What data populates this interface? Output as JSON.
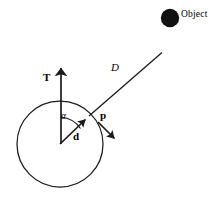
{
  "figure": {
    "width": 223,
    "height": 203,
    "background_color": "#ffffff",
    "stroke_color": "#1a1a1a"
  },
  "labels": {
    "object": "Object",
    "distance": "D",
    "tangent": "T",
    "direction": "d",
    "momentum": "p",
    "angle": "α"
  },
  "geometry": {
    "body_circle": {
      "cx": 60,
      "cy": 144,
      "r": 43
    },
    "object_dot": {
      "cx": 170,
      "cy": 18,
      "r": 9
    },
    "line_D": {
      "x1": 89,
      "y1": 116,
      "x2": 161.5,
      "y2": 53
    },
    "vector_T": {
      "x1": 61,
      "y1": 144,
      "x2": 61,
      "y2": 56
    },
    "vector_d": {
      "x1": 60,
      "y1": 144,
      "x2": 90.5,
      "y2": 114.5
    },
    "vector_p": {
      "x1": 98,
      "y1": 122,
      "x2": 120,
      "y2": 144
    },
    "angle_arc": {
      "cx": 60,
      "cy": 144,
      "r": 27
    }
  },
  "label_positions": {
    "object": {
      "x": 181,
      "y": 10
    },
    "distance": {
      "x": 111,
      "y": 62
    },
    "tangent": {
      "x": 43,
      "y": 72
    },
    "direction": {
      "x": 73,
      "y": 131
    },
    "momentum": {
      "x": 100,
      "y": 110
    },
    "angle": {
      "x": 61,
      "y": 112
    }
  }
}
